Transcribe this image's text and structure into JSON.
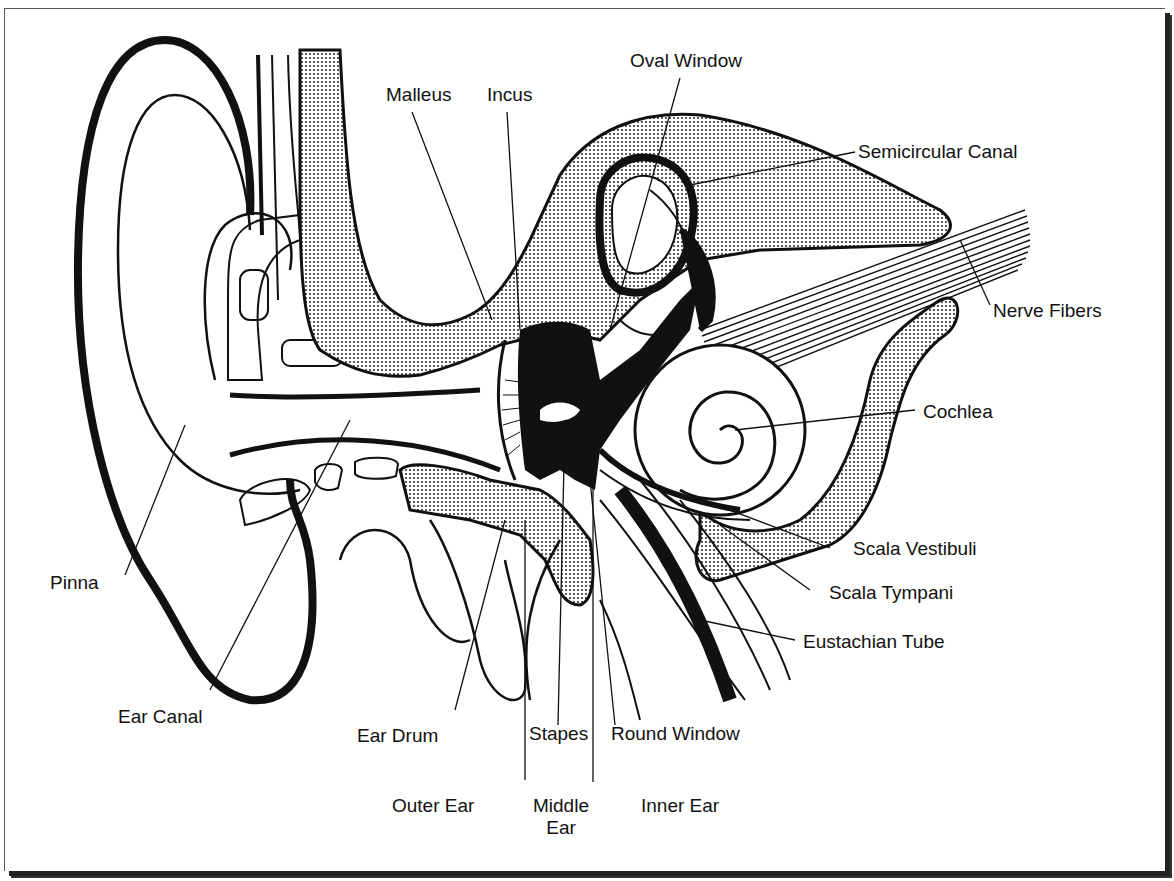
{
  "diagram": {
    "labels": {
      "oval_window": "Oval Window",
      "malleus": "Malleus",
      "incus": "Incus",
      "semicircular_canal": "Semicircular Canal",
      "nerve_fibers": "Nerve Fibers",
      "cochlea": "Cochlea",
      "scala_vestibuli": "Scala Vestibuli",
      "scala_tympani": "Scala Tympani",
      "eustachian_tube": "Eustachian Tube",
      "pinna": "Pinna",
      "ear_canal": "Ear Canal",
      "ear_drum": "Ear Drum",
      "stapes": "Stapes",
      "round_window": "Round Window"
    },
    "regions": {
      "outer_ear": "Outer Ear",
      "middle_ear_line1": "Middle",
      "middle_ear_line2": "Ear",
      "inner_ear": "Inner Ear"
    },
    "colors": {
      "ink": "#111111",
      "paper": "#ffffff",
      "bone_fill": "#b5b5b5"
    }
  }
}
